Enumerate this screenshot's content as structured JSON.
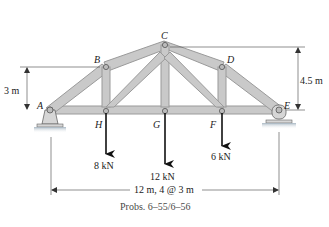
{
  "diagram": {
    "type": "truss",
    "joints": [
      {
        "id": "A",
        "label": "A",
        "x": 50,
        "y": 110
      },
      {
        "id": "H",
        "label": "H",
        "x": 105,
        "y": 111
      },
      {
        "id": "G",
        "label": "G",
        "x": 165,
        "y": 111
      },
      {
        "id": "F",
        "label": "F",
        "x": 222,
        "y": 111
      },
      {
        "id": "E",
        "label": "E",
        "x": 279,
        "y": 110
      },
      {
        "id": "B",
        "label": "B",
        "x": 106,
        "y": 67
      },
      {
        "id": "C",
        "label": "C",
        "x": 165,
        "y": 45
      },
      {
        "id": "D",
        "label": "D",
        "x": 222,
        "y": 67
      }
    ],
    "loads": [
      {
        "at": "H",
        "label": "8 kN"
      },
      {
        "at": "G",
        "label": "12 kN"
      },
      {
        "at": "F",
        "label": "6 kN"
      }
    ],
    "dimensions": {
      "left_height": "3 m",
      "right_height": "4.5 m",
      "span": "12 m, 4 @ 3 m"
    },
    "caption": "Probs. 6–55/6–56",
    "colors": {
      "member_fill": "#c9c9c9",
      "member_stroke": "#9a9a9a",
      "line": "#333333",
      "ground": "#b8c3cc"
    }
  }
}
